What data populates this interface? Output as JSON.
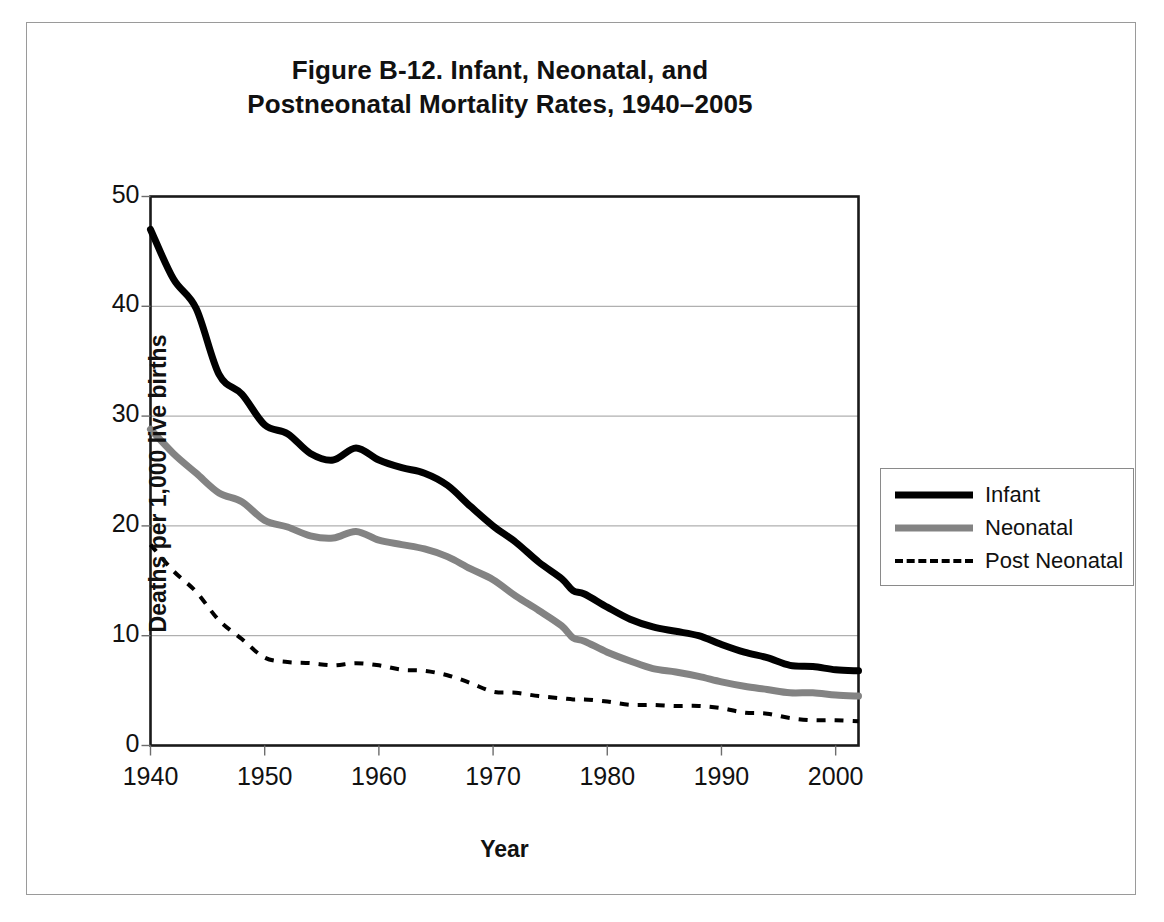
{
  "figure": {
    "title_line1": "Figure B-12. Infant, Neonatal, and",
    "title_line2": "Postneonatal Mortality Rates, 1940–2005"
  },
  "axes": {
    "y_title": "Deaths per 1,000 live births",
    "x_title": "Year",
    "y_ticks": [
      "0",
      "10",
      "20",
      "30",
      "40",
      "50"
    ],
    "x_ticks": [
      "1940",
      "1950",
      "1960",
      "1970",
      "1980",
      "1990",
      "2000"
    ]
  },
  "legend": {
    "items": [
      {
        "label": "Infant",
        "swatch": "solid-thick-black",
        "color": "#000000"
      },
      {
        "label": "Neonatal",
        "swatch": "solid-thick-gray",
        "color": "#838383"
      },
      {
        "label": "Post Neonatal",
        "swatch": "dashed-black",
        "color": "#000000"
      }
    ]
  },
  "chart_data": {
    "type": "line",
    "title": "Figure B-12. Infant, Neonatal, and Postneonatal Mortality Rates, 1940–2005",
    "xlabel": "Year",
    "ylabel": "Deaths per 1,000 live births",
    "xlim": [
      1940,
      2002
    ],
    "ylim": [
      0,
      50
    ],
    "y_ticks": [
      0,
      10,
      20,
      30,
      40,
      50
    ],
    "x_ticks": [
      1940,
      1950,
      1960,
      1970,
      1980,
      1990,
      2000
    ],
    "grid": "horizontal",
    "legend_position": "right-outside",
    "x": [
      1940,
      1942,
      1944,
      1946,
      1948,
      1950,
      1952,
      1954,
      1956,
      1958,
      1960,
      1962,
      1964,
      1966,
      1968,
      1970,
      1972,
      1974,
      1976,
      1977,
      1978,
      1980,
      1982,
      1984,
      1986,
      1988,
      1990,
      1992,
      1994,
      1996,
      1998,
      2000,
      2002
    ],
    "series": [
      {
        "name": "Infant",
        "color": "#000000",
        "style": "solid",
        "width": 7,
        "values": [
          47.0,
          42.5,
          39.8,
          33.8,
          32.0,
          29.2,
          28.4,
          26.6,
          26.0,
          27.1,
          26.0,
          25.3,
          24.8,
          23.7,
          21.8,
          20.0,
          18.5,
          16.7,
          15.2,
          14.1,
          13.8,
          12.6,
          11.5,
          10.8,
          10.4,
          10.0,
          9.2,
          8.5,
          8.0,
          7.3,
          7.2,
          6.9,
          6.8
        ]
      },
      {
        "name": "Neonatal",
        "color": "#838383",
        "style": "solid",
        "width": 7,
        "values": [
          28.8,
          26.6,
          24.8,
          23.0,
          22.2,
          20.5,
          19.9,
          19.1,
          18.9,
          19.5,
          18.7,
          18.3,
          17.9,
          17.2,
          16.1,
          15.1,
          13.6,
          12.3,
          10.9,
          9.8,
          9.5,
          8.5,
          7.7,
          7.0,
          6.7,
          6.3,
          5.8,
          5.4,
          5.1,
          4.8,
          4.8,
          4.6,
          4.5
        ]
      },
      {
        "name": "Post Neonatal",
        "color": "#000000",
        "style": "dashed",
        "width": 4,
        "values": [
          18.3,
          15.9,
          14.0,
          11.4,
          9.7,
          8.0,
          7.6,
          7.5,
          7.3,
          7.5,
          7.3,
          6.9,
          6.8,
          6.4,
          5.7,
          4.9,
          4.8,
          4.5,
          4.3,
          4.2,
          4.2,
          4.0,
          3.7,
          3.7,
          3.6,
          3.6,
          3.4,
          3.0,
          2.9,
          2.5,
          2.3,
          2.3,
          2.2
        ]
      }
    ]
  }
}
